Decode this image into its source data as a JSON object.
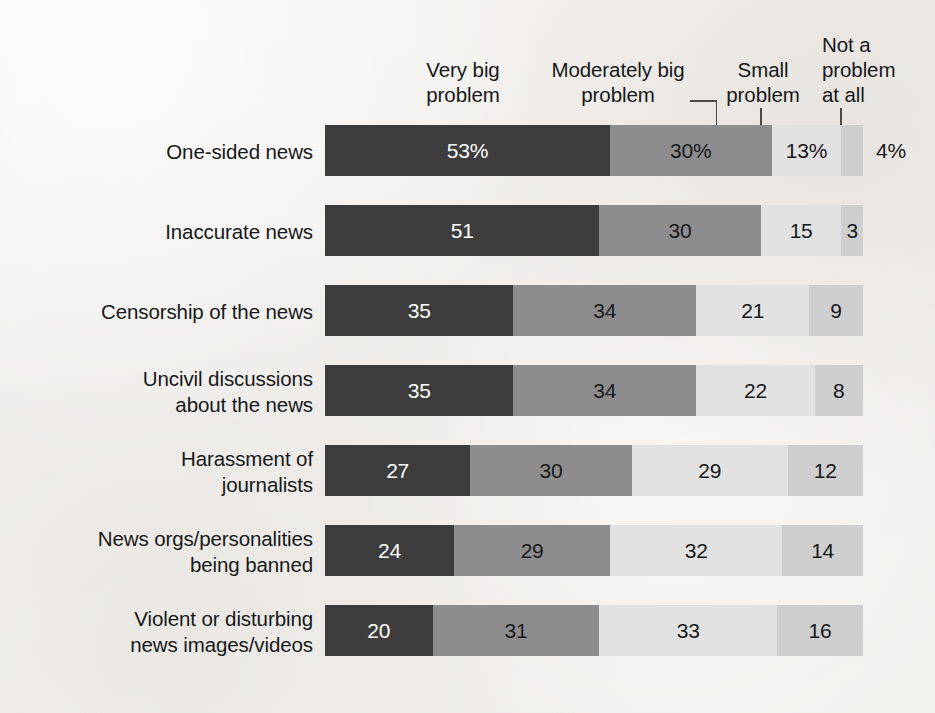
{
  "chart_data": {
    "type": "bar",
    "subtype": "horizontal-stacked-100",
    "title": "",
    "subtitle": "",
    "xlabel": "",
    "ylabel": "",
    "xlim": [
      0,
      100
    ],
    "grid": false,
    "legend_position": "top",
    "categories": [
      "One-sided news",
      "Inaccurate news",
      "Censorship of the news",
      "Uncivil discussions\nabout the news",
      "Harassment of\njournalists",
      "News orgs/personalities\nbeing banned",
      "Violent or disturbing\nnews images/videos"
    ],
    "series": [
      {
        "name": "Very big problem",
        "color": "#3c3c3c",
        "label_color": "#ffffff",
        "values": [
          53,
          51,
          35,
          35,
          27,
          24,
          20
        ],
        "labels": [
          "53%",
          "51",
          "35",
          "35",
          "27",
          "24",
          "20"
        ]
      },
      {
        "name": "Moderately big problem",
        "color": "#8d8d8d",
        "label_color": "#16181a",
        "values": [
          30,
          30,
          34,
          34,
          30,
          29,
          31
        ],
        "labels": [
          "30%",
          "30",
          "34",
          "34",
          "30",
          "29",
          "31"
        ]
      },
      {
        "name": "Small problem",
        "color": "#e2e2e2",
        "label_color": "#16181a",
        "values": [
          13,
          15,
          21,
          22,
          29,
          32,
          33
        ],
        "labels": [
          "13%",
          "15",
          "21",
          "22",
          "29",
          "32",
          "33"
        ]
      },
      {
        "name": "Not a problem at all",
        "color": "#cfcfcf",
        "label_color": "#16181a",
        "values": [
          4,
          3,
          9,
          8,
          12,
          14,
          16
        ],
        "labels": [
          "4%",
          "3",
          "9",
          "8",
          "12",
          "14",
          "16"
        ]
      }
    ]
  },
  "legend": {
    "very_big": "Very big\nproblem",
    "moderately_big": "Moderately big\nproblem",
    "small": "Small\nproblem",
    "not_a_problem": "Not a\nproblem\nat all"
  },
  "rows": [
    {
      "category": "One-sided news",
      "cells": [
        {
          "label": "53%",
          "pct": 53,
          "tone": "dark",
          "outside": false
        },
        {
          "label": "30%",
          "pct": 30,
          "tone": "mid",
          "outside": false
        },
        {
          "label": "13%",
          "pct": 13,
          "tone": "light",
          "outside": false
        },
        {
          "label": "4%",
          "pct": 4,
          "tone": "lighter",
          "outside": true
        }
      ]
    },
    {
      "category": "Inaccurate news",
      "cells": [
        {
          "label": "51",
          "pct": 51,
          "tone": "dark",
          "outside": false
        },
        {
          "label": "30",
          "pct": 30,
          "tone": "mid",
          "outside": false
        },
        {
          "label": "15",
          "pct": 15,
          "tone": "light",
          "outside": false
        },
        {
          "label": "3",
          "pct": 4,
          "tone": "lighter",
          "outside": false
        }
      ]
    },
    {
      "category": "Censorship of the news",
      "cells": [
        {
          "label": "35",
          "pct": 35,
          "tone": "dark",
          "outside": false
        },
        {
          "label": "34",
          "pct": 34,
          "tone": "mid",
          "outside": false
        },
        {
          "label": "21",
          "pct": 21,
          "tone": "light",
          "outside": false
        },
        {
          "label": "9",
          "pct": 10,
          "tone": "lighter",
          "outside": false
        }
      ]
    },
    {
      "category": "Uncivil discussions\nabout the news",
      "cells": [
        {
          "label": "35",
          "pct": 35,
          "tone": "dark",
          "outside": false
        },
        {
          "label": "34",
          "pct": 34,
          "tone": "mid",
          "outside": false
        },
        {
          "label": "22",
          "pct": 22,
          "tone": "light",
          "outside": false
        },
        {
          "label": "8",
          "pct": 9,
          "tone": "lighter",
          "outside": false
        }
      ]
    },
    {
      "category": "Harassment of\njournalists",
      "cells": [
        {
          "label": "27",
          "pct": 27,
          "tone": "dark",
          "outside": false
        },
        {
          "label": "30",
          "pct": 30,
          "tone": "mid",
          "outside": false
        },
        {
          "label": "29",
          "pct": 29,
          "tone": "light",
          "outside": false
        },
        {
          "label": "12",
          "pct": 14,
          "tone": "lighter",
          "outside": false
        }
      ]
    },
    {
      "category": "News orgs/personalities\nbeing banned",
      "cells": [
        {
          "label": "24",
          "pct": 24,
          "tone": "dark",
          "outside": false
        },
        {
          "label": "29",
          "pct": 29,
          "tone": "mid",
          "outside": false
        },
        {
          "label": "32",
          "pct": 32,
          "tone": "light",
          "outside": false
        },
        {
          "label": "14",
          "pct": 15,
          "tone": "lighter",
          "outside": false
        }
      ]
    },
    {
      "category": "Violent or disturbing\nnews images/videos",
      "cells": [
        {
          "label": "20",
          "pct": 20,
          "tone": "dark",
          "outside": false
        },
        {
          "label": "31",
          "pct": 31,
          "tone": "mid",
          "outside": false
        },
        {
          "label": "33",
          "pct": 33,
          "tone": "light",
          "outside": false
        },
        {
          "label": "16",
          "pct": 16,
          "tone": "lighter",
          "outside": false
        }
      ]
    }
  ],
  "colors": {
    "very_big": "#3c3c3c",
    "moderately_big": "#8d8d8d",
    "small": "#e2e2e2",
    "not_a_problem": "#cfcfcf",
    "text": "#16181a",
    "background": "#f2f0ed",
    "leader_line": "#4a4a4a"
  }
}
